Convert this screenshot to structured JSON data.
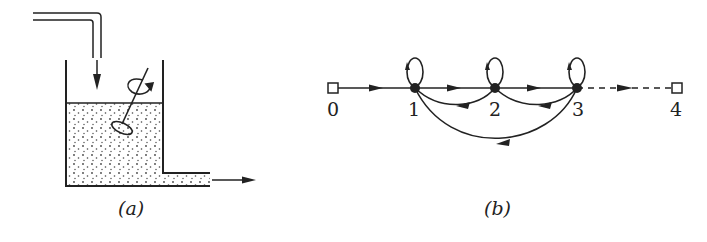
{
  "figure": {
    "panel_a": {
      "caption": "(a)",
      "description": "Stirred tank with inflow pipe from top and outflow pipe at bottom right",
      "elements": [
        "inlet-pipe",
        "inflow-arrow",
        "tank",
        "liquid",
        "stirrer",
        "rotation-arrow",
        "outlet-pipe",
        "outflow-arrow"
      ]
    },
    "panel_b": {
      "caption": "(b)",
      "nodes": [
        {
          "id": "0",
          "label": "0",
          "shape": "square"
        },
        {
          "id": "1",
          "label": "1",
          "shape": "filled-dot"
        },
        {
          "id": "2",
          "label": "2",
          "shape": "filled-dot"
        },
        {
          "id": "3",
          "label": "3",
          "shape": "filled-dot"
        },
        {
          "id": "4",
          "label": "4",
          "shape": "square"
        }
      ],
      "edges": [
        {
          "from": "0",
          "to": "1",
          "style": "solid"
        },
        {
          "from": "1",
          "to": "2",
          "style": "solid"
        },
        {
          "from": "2",
          "to": "3",
          "style": "solid"
        },
        {
          "from": "3",
          "to": "4",
          "style": "dashed"
        },
        {
          "from": "1",
          "to": "1",
          "style": "self-loop"
        },
        {
          "from": "2",
          "to": "2",
          "style": "self-loop"
        },
        {
          "from": "3",
          "to": "3",
          "style": "self-loop"
        },
        {
          "from": "2",
          "to": "1",
          "style": "back-arc"
        },
        {
          "from": "3",
          "to": "2",
          "style": "back-arc"
        },
        {
          "from": "3",
          "to": "1",
          "style": "back-arc"
        }
      ]
    },
    "colors": {
      "ink": "#222222",
      "background": "#ffffff"
    }
  }
}
